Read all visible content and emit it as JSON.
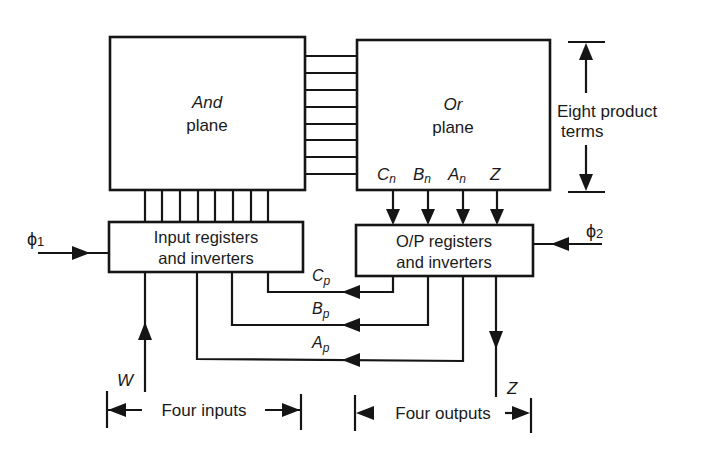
{
  "and_plane": {
    "title": "And",
    "subtitle": "plane"
  },
  "or_plane": {
    "title": "Or",
    "subtitle": "plane",
    "outputs": [
      {
        "base": "C",
        "sub": "n"
      },
      {
        "base": "B",
        "sub": "n"
      },
      {
        "base": "A",
        "sub": "n"
      },
      {
        "base": "Z",
        "sub": ""
      }
    ]
  },
  "product_terms": {
    "line1": "Eight product",
    "line2": "terms",
    "count": 8
  },
  "input_registers": {
    "line1": "Input registers",
    "line2": "and inverters",
    "connections": 8
  },
  "output_registers": {
    "line1": "O/P registers",
    "line2": "and inverters"
  },
  "clocks": {
    "phi1": {
      "symbol": "ϕ",
      "sub": "1"
    },
    "phi2": {
      "symbol": "ϕ",
      "sub": "2"
    }
  },
  "feedback": [
    {
      "base": "C",
      "sub": "p"
    },
    {
      "base": "B",
      "sub": "p"
    },
    {
      "base": "A",
      "sub": "p"
    }
  ],
  "external": {
    "input_signal": "W",
    "output_signal": "Z"
  },
  "dimensions": {
    "inputs_label": "Four inputs",
    "outputs_label": "Four outputs"
  }
}
